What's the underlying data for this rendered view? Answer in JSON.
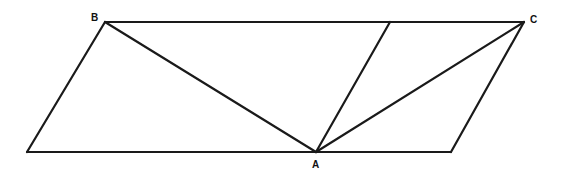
{
  "diagram": {
    "type": "geometry",
    "points": {
      "B": {
        "x": 105,
        "y": 22,
        "label": "B"
      },
      "C": {
        "x": 524,
        "y": 22,
        "label": "C"
      },
      "A": {
        "x": 316,
        "y": 152,
        "label": "A"
      },
      "BL": {
        "x": 27,
        "y": 152
      },
      "BR": {
        "x": 451,
        "y": 152
      },
      "T": {
        "x": 390,
        "y": 22
      }
    },
    "labels": {
      "B": "B",
      "C": "C",
      "A": "A"
    },
    "segments": [
      [
        "B",
        "C"
      ],
      [
        "B",
        "BL"
      ],
      [
        "BL",
        "BR"
      ],
      [
        "BR",
        "C"
      ],
      [
        "B",
        "A"
      ],
      [
        "A",
        "C"
      ],
      [
        "A",
        "T"
      ]
    ],
    "stroke_color": "#1a1a1a"
  }
}
